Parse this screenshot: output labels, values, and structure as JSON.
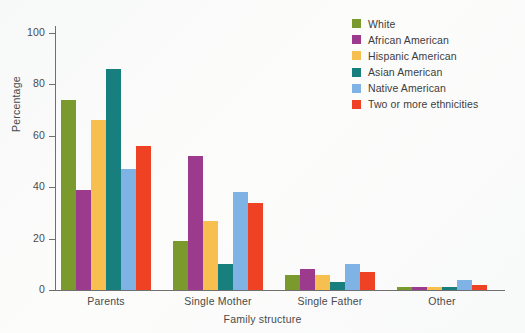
{
  "chart_data": {
    "type": "bar",
    "title": "",
    "xlabel": "Family structure",
    "ylabel": "Percentage",
    "ylim": [
      0,
      100
    ],
    "yticks": [
      0,
      20,
      40,
      60,
      80,
      100
    ],
    "grid": false,
    "legend_position": "top-right",
    "categories": [
      "Parents",
      "Single Mother",
      "Single Father",
      "Other"
    ],
    "series": [
      {
        "name": "White",
        "color": "#7a9a2e",
        "values": [
          74,
          19,
          6,
          1
        ]
      },
      {
        "name": "African American",
        "color": "#9c3b8e",
        "values": [
          39,
          52,
          8,
          1
        ]
      },
      {
        "name": "Hispanic American",
        "color": "#f6bf4f",
        "values": [
          66,
          27,
          6,
          1
        ]
      },
      {
        "name": "Asian American",
        "color": "#17807e",
        "values": [
          86,
          10,
          3,
          1
        ]
      },
      {
        "name": "Native American",
        "color": "#7fb2e5",
        "values": [
          47,
          38,
          10,
          4
        ]
      },
      {
        "name": "Two or more ethnicities",
        "color": "#ef4123",
        "values": [
          56,
          34,
          7,
          2
        ]
      }
    ]
  }
}
